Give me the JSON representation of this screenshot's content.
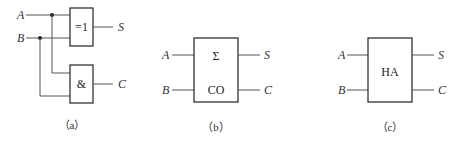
{
  "figure_a": {
    "inputs": [
      "A",
      "B"
    ],
    "xor_gate": {
      "symbol": "=1",
      "output": "S"
    },
    "and_gate": {
      "symbol": "&",
      "output": "C"
    },
    "caption": "（a）"
  },
  "figure_b": {
    "inputs": [
      "A",
      "B"
    ],
    "block_top": "Σ",
    "block_bottom": "CO",
    "outputs": [
      "S",
      "C"
    ],
    "caption": "（b）"
  },
  "figure_c": {
    "inputs": [
      "A",
      "B"
    ],
    "block_label": "HA",
    "outputs": [
      "S",
      "C"
    ],
    "caption": "（c）"
  }
}
